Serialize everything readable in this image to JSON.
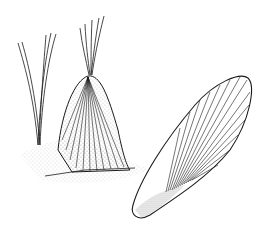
{
  "illustration": {
    "description": "Pen-and-ink stipple drawing of two fan-shaped shells: one upright half-buried in sand with two grass blades behind it, and one lying on its side to the right",
    "colors": {
      "ink": "#1a1a1a",
      "background": "#ffffff"
    },
    "objects": [
      {
        "name": "grass-tuft-left"
      },
      {
        "name": "grass-tuft-center"
      },
      {
        "name": "upright-shell"
      },
      {
        "name": "reclining-shell"
      },
      {
        "name": "sand-ground"
      }
    ]
  }
}
